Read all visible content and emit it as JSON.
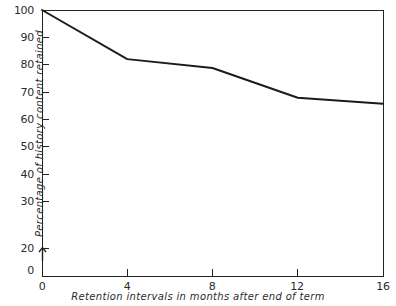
{
  "figure": {
    "background_color": "#ffffff",
    "ink_color": "#1b1b1b"
  },
  "chart_data": {
    "type": "line",
    "title": "",
    "subtitle": "",
    "xlabel": "Retention intervals in months after end of term",
    "ylabel": "Percentage of history content retained",
    "x": [
      0,
      4,
      8,
      12,
      16
    ],
    "values": [
      100,
      83.5,
      80.5,
      70.5,
      68.5
    ],
    "series": [
      {
        "name": "History content retained",
        "x": [
          0,
          4,
          8,
          12,
          16
        ],
        "values": [
          100,
          83.5,
          80.5,
          70.5,
          68.5
        ]
      }
    ],
    "xlim": [
      0,
      16
    ],
    "ylim": [
      20,
      100
    ],
    "y_axis_break": true,
    "y_axis_break_note": "axis broken between 0 and 20",
    "xticks": [
      0,
      4,
      8,
      12,
      16
    ],
    "xticklabels": [
      "0",
      "4",
      "8",
      "12",
      "16"
    ],
    "yticks": [
      20,
      30,
      40,
      50,
      60,
      70,
      80,
      90,
      100
    ],
    "yticklabels": [
      "20",
      "30",
      "40",
      "50",
      "60",
      "70",
      "80",
      "90",
      "100"
    ],
    "y_origin_label": "0",
    "grid": false,
    "legend": false,
    "legend_position": "none",
    "annotations": []
  }
}
